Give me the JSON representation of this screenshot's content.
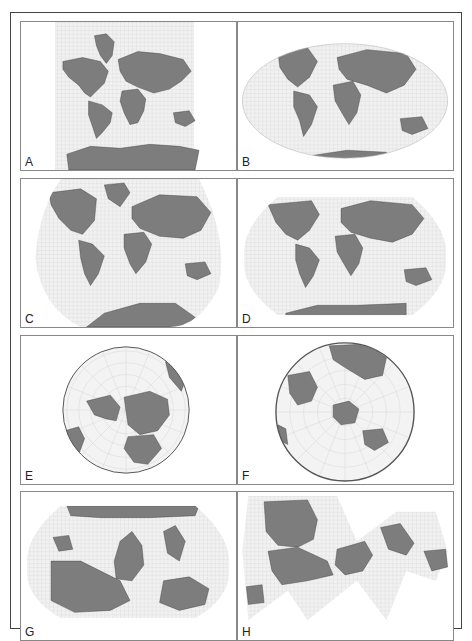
{
  "figure": {
    "colors": {
      "land": "#7d7d7d",
      "land_stroke": "#3a3a3a",
      "ocean": "#f1f1f1",
      "grid": "#c9c9c9",
      "frame": "#444444",
      "panel_border": "#888888"
    },
    "panels": [
      {
        "label": "A",
        "projection": "rectangular (cylindrical)"
      },
      {
        "label": "B",
        "projection": "elliptical (pseudocylindrical)"
      },
      {
        "label": "C",
        "projection": "rounded-edge, wide"
      },
      {
        "label": "D",
        "projection": "rounded-corner oval"
      },
      {
        "label": "E",
        "projection": "circular, north polar"
      },
      {
        "label": "F",
        "projection": "circular, south polar"
      },
      {
        "label": "G",
        "projection": "oval, south-up"
      },
      {
        "label": "H",
        "projection": "interrupted icosahedral"
      }
    ]
  }
}
